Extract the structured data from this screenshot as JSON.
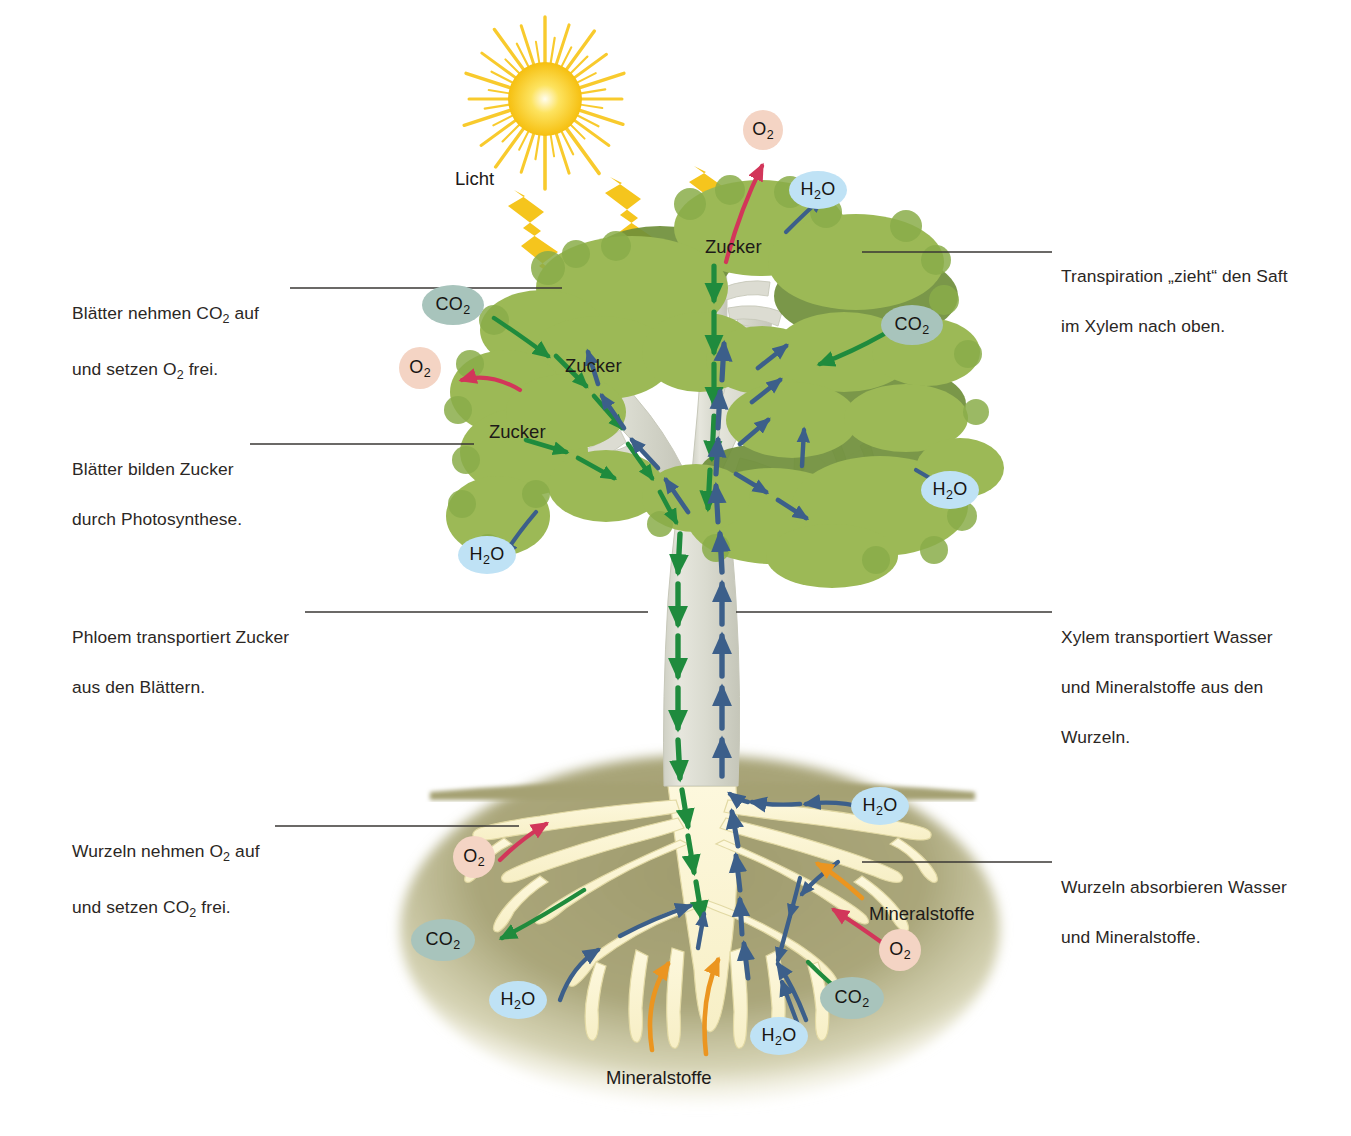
{
  "diagram": {
    "language": "de",
    "background": "#ffffff"
  },
  "palette": {
    "leaf_light": "#9cb956",
    "leaf_mid": "#8aad4a",
    "leaf_dark": "#6d8c3a",
    "bark": "#dcdcd2",
    "bark_shade": "#c3c4b6",
    "soil": "#a8a478",
    "soil_light": "#c0bd95",
    "root": "#fbf4d2",
    "root_edge": "#ddd49a",
    "sun": "#f7c416",
    "sun_core": "#fdf39a",
    "light_arrow": "#f5c51d",
    "phloem_green": "#1f8b3d",
    "xylem_blue": "#3c5f8a",
    "mineral_orange": "#eb9520",
    "o2_arrow": "#d2365a",
    "co2_bubble": "#a8c4bc",
    "o2_bubble": "#f4d4c4",
    "h2o_bubble": "#bfe2f5",
    "leader_line": "#3a3734",
    "text": "#2b2724"
  },
  "callouts": {
    "left": [
      {
        "id": "leaves-co2-o2",
        "line1": "Blätter nehmen CO",
        "sub1": "2",
        "line1b": " auf",
        "line2": "und setzen O",
        "sub2": "2",
        "line2b": " frei.",
        "plain": "Blätter nehmen CO2 auf und setzen O2 frei.",
        "x": 72,
        "y": 276,
        "leader": {
          "x1": 290,
          "y1": 288,
          "x2": 562,
          "y2": 288
        }
      },
      {
        "id": "leaves-sugar",
        "line1": "Blätter bilden Zucker",
        "line2": "durch Photosynthese.",
        "plain": "Blätter bilden Zucker durch Photosynthese.",
        "x": 72,
        "y": 432,
        "leader": {
          "x1": 250,
          "y1": 444,
          "x2": 474,
          "y2": 444
        }
      },
      {
        "id": "phloem-sugar",
        "line1": "Phloem transportiert Zucker",
        "line2": "aus den Blättern.",
        "plain": "Phloem transportiert Zucker aus den Blättern.",
        "x": 72,
        "y": 600,
        "leader": {
          "x1": 305,
          "y1": 612,
          "x2": 648,
          "y2": 612
        }
      },
      {
        "id": "roots-o2-co2",
        "line1": "Wurzeln nehmen O",
        "sub1": "2",
        "line1b": " auf",
        "line2": "und setzen CO",
        "sub2": "2",
        "line2b": " frei.",
        "plain": "Wurzeln nehmen O2 auf und setzen CO2 frei.",
        "x": 72,
        "y": 814,
        "leader": {
          "x1": 275,
          "y1": 826,
          "x2": 519,
          "y2": 826
        }
      }
    ],
    "right": [
      {
        "id": "transpiration",
        "line1": "Transpiration „zieht“ den Saft",
        "line2": "im Xylem nach oben.",
        "plain": "Transpiration „zieht“ den Saft im Xylem nach oben.",
        "x": 1061,
        "y": 239,
        "leader": {
          "x1": 862,
          "y1": 252,
          "x2": 1052,
          "y2": 252
        }
      },
      {
        "id": "xylem-transport",
        "line1": "Xylem transportiert Wasser",
        "line2": "und Mineralstoffe aus den",
        "line3": "Wurzeln.",
        "plain": "Xylem transportiert Wasser und Mineralstoffe aus den Wurzeln.",
        "x": 1061,
        "y": 600,
        "leader": {
          "x1": 736,
          "y1": 612,
          "x2": 1052,
          "y2": 612
        }
      },
      {
        "id": "roots-absorb",
        "line1": "Wurzeln absorbieren Wasser",
        "line2": "und Mineralstoffe.",
        "plain": "Wurzeln absorbieren Wasser und Mineralstoffe.",
        "x": 1061,
        "y": 850,
        "leader": {
          "x1": 862,
          "y1": 862,
          "x2": 1052,
          "y2": 862
        }
      }
    ]
  },
  "art_labels": [
    {
      "id": "licht",
      "text": "Licht",
      "x": 455,
      "y": 168
    },
    {
      "id": "zucker-top",
      "text": "Zucker",
      "x": 705,
      "y": 236
    },
    {
      "id": "zucker-mid",
      "text": "Zucker",
      "x": 565,
      "y": 355
    },
    {
      "id": "zucker-low",
      "text": "Zucker",
      "x": 489,
      "y": 421
    },
    {
      "id": "mineralstoffe-r",
      "text": "Mineralstoffe",
      "x": 869,
      "y": 903
    },
    {
      "id": "mineralstoffe-b",
      "text": "Mineralstoffe",
      "x": 606,
      "y": 1067
    }
  ],
  "molecules": [
    {
      "id": "o2-canopy-top",
      "species": "O",
      "sub": "2",
      "shape": "circle",
      "fill": "o2_bubble",
      "x": 763,
      "y": 130,
      "w": 40,
      "h": 40
    },
    {
      "id": "h2o-canopy-top",
      "species": "H",
      "sub": "2",
      "tail": "O",
      "shape": "ellipse",
      "fill": "h2o_bubble",
      "x": 818,
      "y": 190,
      "w": 58,
      "h": 38
    },
    {
      "id": "co2-left",
      "species": "CO",
      "sub": "2",
      "shape": "ellipse",
      "fill": "co2_bubble",
      "x": 453,
      "y": 305,
      "w": 62,
      "h": 40
    },
    {
      "id": "co2-right",
      "species": "CO",
      "sub": "2",
      "shape": "ellipse",
      "fill": "co2_bubble",
      "x": 912,
      "y": 325,
      "w": 62,
      "h": 40
    },
    {
      "id": "o2-canopy-left",
      "species": "O",
      "sub": "2",
      "shape": "circle",
      "fill": "o2_bubble",
      "x": 420,
      "y": 368,
      "w": 42,
      "h": 42
    },
    {
      "id": "h2o-right-mid",
      "species": "H",
      "sub": "2",
      "tail": "O",
      "shape": "ellipse",
      "fill": "h2o_bubble",
      "x": 950,
      "y": 490,
      "w": 58,
      "h": 38
    },
    {
      "id": "h2o-left-mid",
      "species": "H",
      "sub": "2",
      "tail": "O",
      "shape": "ellipse",
      "fill": "h2o_bubble",
      "x": 487,
      "y": 555,
      "w": 58,
      "h": 38
    },
    {
      "id": "h2o-root-right",
      "species": "H",
      "sub": "2",
      "tail": "O",
      "shape": "ellipse",
      "fill": "h2o_bubble",
      "x": 880,
      "y": 806,
      "w": 58,
      "h": 38
    },
    {
      "id": "o2-root-left",
      "species": "O",
      "sub": "2",
      "shape": "circle",
      "fill": "o2_bubble",
      "x": 474,
      "y": 857,
      "w": 42,
      "h": 42
    },
    {
      "id": "co2-root-left",
      "species": "CO",
      "sub": "2",
      "shape": "ellipse",
      "fill": "co2_bubble",
      "x": 443,
      "y": 940,
      "w": 64,
      "h": 42
    },
    {
      "id": "o2-root-right",
      "species": "O",
      "sub": "2",
      "shape": "circle",
      "fill": "o2_bubble",
      "x": 900,
      "y": 950,
      "w": 42,
      "h": 42
    },
    {
      "id": "co2-root-right",
      "species": "CO",
      "sub": "2",
      "shape": "ellipse",
      "fill": "co2_bubble",
      "x": 852,
      "y": 998,
      "w": 64,
      "h": 42
    },
    {
      "id": "h2o-root-bl",
      "species": "H",
      "sub": "2",
      "tail": "O",
      "shape": "ellipse",
      "fill": "h2o_bubble",
      "x": 518,
      "y": 1000,
      "w": 58,
      "h": 38
    },
    {
      "id": "h2o-root-bc",
      "species": "H",
      "sub": "2",
      "tail": "O",
      "shape": "ellipse",
      "fill": "h2o_bubble",
      "x": 779,
      "y": 1036,
      "w": 58,
      "h": 38
    }
  ],
  "flows": {
    "phloem": {
      "label": "Zucker (Phloem, abwärts)",
      "color": "#1f8b3d",
      "direction": "down"
    },
    "xylem": {
      "label": "Wasser und Mineralstoffe (Xylem, aufwärts)",
      "color": "#3c5f8a",
      "direction": "up"
    },
    "minerals": {
      "label": "Mineralstoffe",
      "color": "#eb9520",
      "direction": "up"
    },
    "oxygen": {
      "label": "O2",
      "color": "#d2365a"
    },
    "light": {
      "label": "Licht",
      "color": "#f5c51d",
      "count": 3
    }
  }
}
